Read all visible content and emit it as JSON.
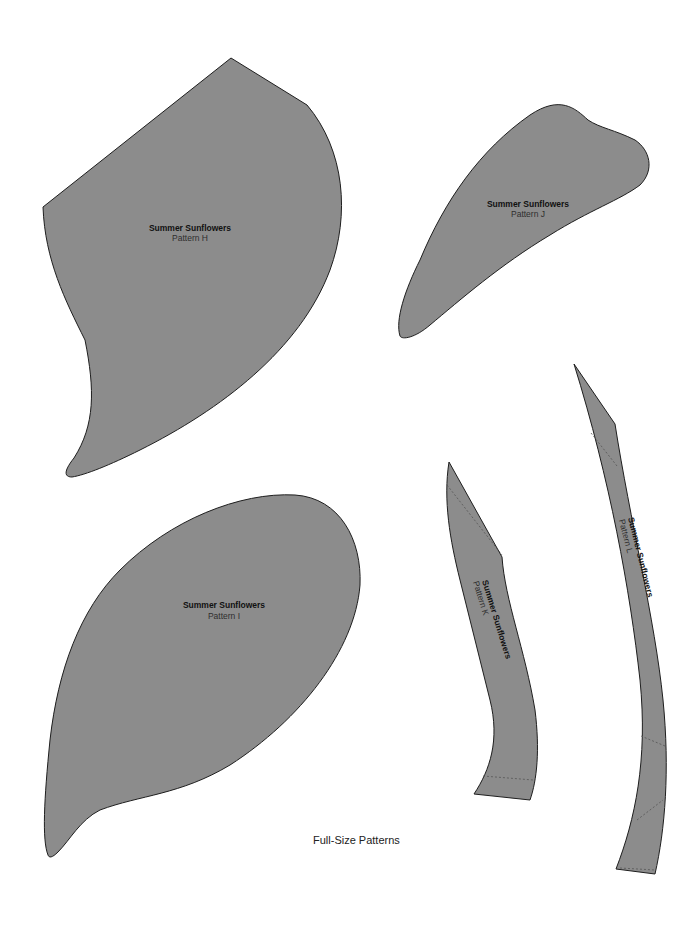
{
  "document": {
    "caption": "Full-Size Patterns",
    "colors": {
      "fill": "#8c8c8c",
      "outline": "#1e1e1e",
      "background": "#ffffff"
    }
  },
  "patterns": [
    {
      "id": "H",
      "title": "Summer Sunflowers",
      "label": "Pattern H"
    },
    {
      "id": "J",
      "title": "Summer Sunflowers",
      "label": "Pattern J"
    },
    {
      "id": "I",
      "title": "Summer Sunflowers",
      "label": "Pattern I"
    },
    {
      "id": "K",
      "title": "Summer Sunflowers",
      "label": "Pattern K"
    },
    {
      "id": "L",
      "title": "Summer Sunflowers",
      "label": "Pattern L"
    }
  ]
}
